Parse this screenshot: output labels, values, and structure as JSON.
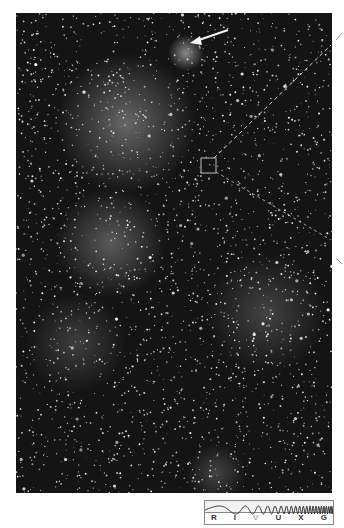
{
  "image": {
    "subject": "Milky Way star field photograph (grayscale)",
    "annotations": {
      "arrow": "arrow pointing to bright nebula near top",
      "box": "small square marker near center",
      "dashed_lines": "two dashed guide lines from box toward right edge"
    }
  },
  "wavelength_scale": {
    "bands": [
      {
        "label": "R",
        "active": false
      },
      {
        "label": "I",
        "active": false
      },
      {
        "label": "V",
        "active": true
      },
      {
        "label": "U",
        "active": false
      },
      {
        "label": "X",
        "active": false
      },
      {
        "label": "G",
        "active": false
      }
    ]
  },
  "colors": {
    "background": "#ffffff",
    "sky": "#141414",
    "annotation": "#dddddd"
  }
}
